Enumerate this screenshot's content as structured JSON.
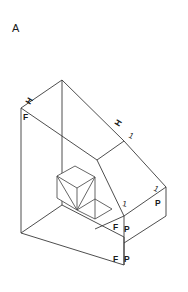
{
  "figure": {
    "caption": "A",
    "type": "isometric-technical-drawing",
    "background_color": "#ffffff",
    "line_color": "#3a3a3a",
    "labels": [
      {
        "id": "caption-a",
        "text": "A",
        "x": 12,
        "y": 32,
        "rotation": 0,
        "kind": "caption"
      },
      {
        "id": "left-top-h",
        "text": "H",
        "x": 30,
        "y": 105,
        "rotation": -58,
        "kind": "mark"
      },
      {
        "id": "left-top-f",
        "text": "F",
        "x": 23,
        "y": 120,
        "rotation": 0,
        "kind": "mark"
      },
      {
        "id": "right-top-h",
        "text": "H",
        "x": 119,
        "y": 127,
        "rotation": -58,
        "kind": "mark"
      },
      {
        "id": "right-top-tick",
        "text": "1",
        "x": 128,
        "y": 137,
        "rotation": 28,
        "kind": "tick"
      },
      {
        "id": "right-mid-tick",
        "text": "1",
        "x": 153,
        "y": 190,
        "rotation": 28,
        "kind": "tick"
      },
      {
        "id": "right-mid-p",
        "text": "P",
        "x": 155,
        "y": 206,
        "rotation": 0,
        "kind": "mark"
      },
      {
        "id": "center-tick",
        "text": "1",
        "x": 122,
        "y": 206,
        "rotation": 10,
        "kind": "tick"
      },
      {
        "id": "center-f",
        "text": "F",
        "x": 113,
        "y": 230,
        "rotation": 0,
        "kind": "mark"
      },
      {
        "id": "center-p",
        "text": "P",
        "x": 124,
        "y": 232,
        "rotation": 0,
        "kind": "mark"
      },
      {
        "id": "bottom-f",
        "text": "F",
        "x": 113,
        "y": 262,
        "rotation": 0,
        "kind": "mark"
      },
      {
        "id": "bottom-p",
        "text": "P",
        "x": 124,
        "y": 262,
        "rotation": 0,
        "kind": "mark"
      }
    ],
    "geometry": {
      "outer_outline": "M 21,108 L 21,233 L 124,265 L 124,243 L 166,216 L 166,187 L 124,141 L 62,80 L 21,108 Z",
      "left_wall_front": "M 21,108 L 21,233 L 62,205 L 62,80 Z",
      "left_wall_top": "M 21,108 L 62,80 L 124,141 L 97,160 Z",
      "cavity_floor": "M 21,233 L 124,265 L 124,243 L 62,205 Z",
      "incline_face": "M 97,160 L 124,141 L 124,216 L 95,229 Z",
      "right_block_top": "M 124,141 L 166,187 L 124,216 Z",
      "right_block_face": "M 124,216 L 166,187 L 166,216 L 124,243 Z",
      "edges": [
        "M 21,108 L 62,80",
        "M 62,80 L 124,141",
        "M 21,108 L 21,233",
        "M 62,80 L 62,167",
        "M 21,233 L 124,265",
        "M 124,265 L 124,243",
        "M 124,243 L 166,216",
        "M 166,216 L 166,187",
        "M 166,187 L 124,141",
        "M 21,233 L 62,205",
        "M 62,205 L 124,237",
        "M 124,237 L 124,265",
        "M 62,205 L 62,167",
        "M 21,108 L 97,160",
        "M 97,160 L 124,141",
        "M 97,160 L 124,216",
        "M 124,216 L 166,187",
        "M 124,216 L 124,243",
        "M 124,216 L 124,237",
        "M 95,229 L 124,216"
      ],
      "frustum": {
        "top_face": "M 57,176 L 75,166 L 95,177 L 77,188 Z",
        "left_face": "M 57,176 L 77,188 L 77,210 L 57,198 Z",
        "right_face": "M 77,188 L 95,177 L 95,199 L 77,210 Z",
        "base_edges": [
          "M 57,198 L 77,210",
          "M 77,210 L 95,199",
          "M 57,176 L 57,198",
          "M 77,188 L 77,210",
          "M 95,177 L 95,199"
        ],
        "diagonals": [
          "M 57,176 L 77,210",
          "M 95,177 L 77,210"
        ],
        "skirt": "M 77,210 L 95,199 L 112,209 L 95,219 Z"
      }
    }
  }
}
